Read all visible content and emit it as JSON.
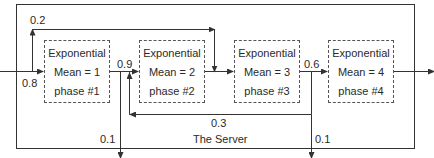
{
  "diagram": {
    "container_label": "The Server",
    "colors": {
      "line": "#333333",
      "text": "#2a2a2a",
      "box_border": "#555555",
      "background": "#ffffff"
    },
    "phases": [
      {
        "line1": "Exponential",
        "line2": "Mean = 1",
        "line3": "phase #1"
      },
      {
        "line1": "Exponential",
        "line2": "Mean = 2",
        "line3": "phase #2"
      },
      {
        "line1": "Exponential",
        "line2": "Mean = 3",
        "line3": "phase #3"
      },
      {
        "line1": "Exponential",
        "line2": "Mean = 4",
        "line3": "phase #4"
      }
    ],
    "probabilities": {
      "skip_to_phase3": "0.2",
      "enter_phase1": "0.8",
      "phase1_to_phase2": "0.9",
      "phase1_exit": "0.1",
      "phase3_to_phase4": "0.6",
      "phase3_back_to_phase2": "0.3",
      "phase3_exit": "0.1"
    }
  }
}
